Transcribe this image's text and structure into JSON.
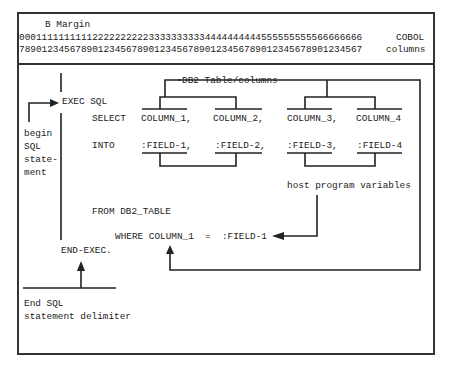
{
  "header": {
    "margin_label": "B Margin",
    "ruler_tens": "0001111111111222222222233333333334444444444555555555566666666",
    "ruler_units": "7890123456789012345678901234567890123456789012345678901234567",
    "right_label_1": "COBOL",
    "right_label_2": "columns"
  },
  "code": {
    "exec_sql": "EXEC SQL",
    "select_kw": "SELECT",
    "into_kw": "INTO",
    "columns": [
      "COLUMN_1,",
      "COLUMN_2,",
      "COLUMN_3,",
      "COLUMN_4"
    ],
    "fields": [
      ":FIELD-1,",
      ":FIELD-2,",
      ":FIELD-3,",
      ":FIELD-4"
    ],
    "from_clause": "FROM DB2_TABLE",
    "where_clause": "WHERE COLUMN_1  =  :FIELD-1",
    "end_exec": "END-EXEC."
  },
  "annotations": {
    "db2_label": "DB2 Table/columns",
    "host_vars_label": "host program variables",
    "begin_label": [
      "begin",
      "SQL",
      "state-",
      "ment"
    ],
    "end_label": [
      "End SQL",
      "statement delimiter"
    ]
  }
}
